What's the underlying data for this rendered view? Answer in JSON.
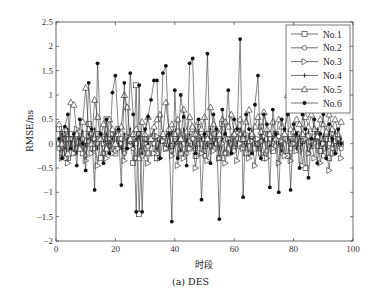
{
  "chart_data": {
    "type": "line",
    "title": "",
    "caption": "(a) DES",
    "xlabel": "时段",
    "ylabel": "RMSE/ns",
    "xlim": [
      0,
      100
    ],
    "ylim": [
      -2,
      2.5
    ],
    "xticks": [
      0,
      20,
      40,
      60,
      80,
      100
    ],
    "yticks": [
      -2,
      -1.5,
      -1,
      -0.5,
      0,
      0.5,
      1,
      1.5,
      2,
      2.5
    ],
    "ytick_labels": [
      "-2",
      "-1.5",
      "-1",
      "-0.5",
      "0",
      "0.5",
      "1",
      "1.5",
      "2",
      "2.5"
    ],
    "grid": false,
    "legend_position": "upper right",
    "series": [
      {
        "name": "No.1",
        "marker": "square",
        "values": [
          0.3,
          -0.2,
          0.1,
          -0.3,
          0.2,
          0.0,
          -0.1,
          0.15,
          -0.2,
          0.05,
          0.4,
          -0.1,
          0.0,
          0.2,
          -0.3,
          0.1,
          0.5,
          -0.05,
          0.1,
          -0.2,
          0.3,
          0.0,
          -0.15,
          0.1,
          0.05,
          -0.4,
          1.2,
          -1.45,
          0.2,
          0.1,
          -0.2,
          0.0,
          0.15,
          -0.3,
          0.1,
          0.05,
          -0.1,
          0.2,
          -0.05,
          0.1,
          0.25,
          -0.2,
          0.0,
          0.15,
          -0.1,
          0.3,
          -0.25,
          0.1,
          0.0,
          -0.15,
          0.2,
          0.05,
          -0.1,
          0.15,
          -0.3,
          0.4,
          -0.2,
          0.1,
          0.0,
          -0.1,
          0.25,
          -0.05,
          0.1,
          -0.2,
          0.05,
          0.15,
          -0.1,
          0.0,
          0.35,
          -0.3,
          0.1,
          0.05,
          -0.15,
          0.2,
          0.0,
          -0.1,
          0.15,
          -0.25,
          0.1,
          0.0,
          0.2,
          -0.1,
          0.05,
          -0.5,
          0.15,
          -0.05,
          0.1,
          0.2,
          -0.15,
          0.0,
          0.1,
          -0.3,
          0.25,
          -0.1,
          0.05,
          0.0
        ]
      },
      {
        "name": "No.2",
        "marker": "circle",
        "values": [
          -0.1,
          0.2,
          -0.3,
          0.1,
          0.0,
          -0.2,
          0.15,
          -0.05,
          0.1,
          -0.25,
          0.05,
          0.2,
          -0.1,
          0.0,
          0.15,
          -0.2,
          0.1,
          -0.05,
          0.2,
          -0.15,
          0.0,
          0.1,
          -0.2,
          0.05,
          0.15,
          -0.1,
          0.0,
          0.2,
          -0.25,
          0.1,
          -0.05,
          0.15,
          0.0,
          -0.2,
          0.1,
          0.05,
          -0.1,
          0.2,
          -0.15,
          0.0,
          0.1,
          -0.05,
          0.2,
          -0.2,
          0.05,
          0.1,
          -0.1,
          0.0,
          0.15,
          -0.25,
          0.1,
          -0.05,
          0.2,
          0.0,
          -0.1,
          0.15,
          -0.2,
          0.05,
          0.1,
          -0.15,
          0.0,
          0.2,
          -0.05,
          0.1,
          -0.2,
          0.15,
          0.0,
          -0.1,
          0.05,
          0.2,
          -0.15,
          0.1,
          0.0,
          -0.05,
          0.15,
          -0.2,
          0.1,
          0.05,
          -0.1,
          0.0,
          0.2,
          -0.15,
          0.05,
          0.1,
          -0.2,
          0.0,
          0.15,
          -0.05,
          0.1,
          -0.25,
          0.2,
          0.0,
          -0.1,
          0.05,
          0.15,
          -0.1
        ]
      },
      {
        "name": "No.3",
        "marker": "triangle-right",
        "values": [
          0.0,
          -0.3,
          0.2,
          -0.4,
          0.1,
          -0.2,
          0.3,
          -0.1,
          0.0,
          -0.35,
          0.15,
          -0.2,
          0.1,
          -0.45,
          0.2,
          0.0,
          -0.3,
          0.1,
          -0.2,
          0.25,
          -0.1,
          0.0,
          -0.35,
          0.15,
          -0.05,
          0.1,
          -0.3,
          0.2,
          -0.15,
          0.0,
          -0.4,
          0.1,
          -0.2,
          0.15,
          -0.3,
          0.05,
          -0.1,
          0.2,
          -0.25,
          0.0,
          -0.45,
          0.1,
          -0.3,
          0.2,
          -0.1,
          0.0,
          -0.5,
          0.15,
          -0.2,
          0.1,
          -0.35,
          0.05,
          -0.15,
          0.2,
          -0.3,
          0.0,
          -0.4,
          0.1,
          -0.2,
          0.15,
          -0.35,
          0.0,
          -0.1,
          0.2,
          -0.3,
          0.05,
          -0.45,
          0.1,
          -0.2,
          0.15,
          -0.3,
          0.0,
          -0.1,
          0.2,
          -0.4,
          0.05,
          -0.25,
          0.1,
          -0.35,
          0.0,
          -0.15,
          0.2,
          -0.45,
          0.1,
          -0.2,
          0.05,
          -0.3,
          0.15,
          -0.4,
          0.0,
          -0.1,
          -0.55,
          0.2,
          -0.2,
          0.1,
          -0.3
        ]
      },
      {
        "name": "No.4",
        "marker": "plus-dot",
        "values": [
          0.1,
          0.2,
          -0.1,
          0.3,
          0.0,
          0.15,
          -0.2,
          0.1,
          0.25,
          -0.05,
          0.2,
          0.0,
          0.3,
          -0.1,
          0.15,
          0.05,
          0.2,
          -0.15,
          0.1,
          0.25,
          0.0,
          -0.1,
          0.2,
          0.05,
          0.3,
          -0.05,
          0.1,
          0.15,
          -0.2,
          0.25,
          0.0,
          0.1,
          0.3,
          -0.1,
          0.05,
          0.2,
          0.15,
          -0.05,
          0.25,
          0.0,
          0.1,
          -0.15,
          0.3,
          0.05,
          0.2,
          0.0,
          -0.1,
          0.25,
          0.1,
          0.15,
          -0.05,
          0.3,
          0.0,
          0.2,
          -0.1,
          0.1,
          0.25,
          0.05,
          -0.15,
          0.2,
          0.0,
          0.3,
          0.1,
          -0.05,
          0.15,
          0.25,
          0.0,
          -0.1,
          0.2,
          0.05,
          0.3,
          -0.05,
          0.1,
          0.2,
          0.0,
          -0.15,
          0.25,
          0.1,
          0.05,
          0.3,
          -0.1,
          0.15,
          0.0,
          0.2,
          0.25,
          -0.05,
          0.1,
          0.3,
          0.0,
          0.15,
          -0.1,
          0.2,
          0.05,
          0.25,
          0.0,
          0.1
        ]
      },
      {
        "name": "No.5",
        "marker": "triangle-up",
        "values": [
          0.4,
          0.0,
          0.3,
          -0.2,
          0.85,
          0.8,
          0.2,
          -0.1,
          0.45,
          1.15,
          0.3,
          0.0,
          0.9,
          0.55,
          0.1,
          0.4,
          -0.1,
          0.5,
          0.3,
          0.0,
          0.2,
          0.35,
          1.0,
          0.75,
          0.1,
          0.2,
          0.3,
          -0.3,
          0.45,
          0.2,
          0.55,
          0.1,
          0.35,
          0.5,
          0.6,
          0.2,
          0.85,
          0.3,
          0.4,
          0.2,
          0.5,
          0.1,
          0.7,
          0.25,
          0.55,
          0.35,
          0.2,
          0.45,
          0.3,
          0.55,
          0.1,
          0.75,
          0.4,
          0.3,
          0.2,
          0.5,
          0.45,
          0.35,
          0.6,
          0.2,
          0.3,
          0.5,
          0.1,
          0.45,
          0.7,
          0.2,
          0.35,
          0.55,
          0.25,
          0.65,
          0.3,
          0.2,
          0.45,
          0.1,
          0.5,
          0.35,
          0.2,
          1.0,
          0.3,
          0.25,
          0.5,
          0.4,
          0.2,
          0.55,
          0.35,
          0.6,
          0.3,
          0.15,
          0.5,
          0.4,
          0.25,
          0.6,
          0.3,
          0.5,
          0.2,
          0.45
        ]
      },
      {
        "name": "No.6",
        "marker": "filled-dot",
        "values": [
          0.1,
          -0.3,
          0.35,
          0.6,
          -0.1,
          0.2,
          -0.45,
          0.5,
          0.0,
          -0.55,
          1.25,
          0.3,
          -0.95,
          1.65,
          0.2,
          -0.4,
          0.5,
          -0.2,
          1.05,
          1.4,
          0.3,
          -0.85,
          1.25,
          -0.1,
          1.45,
          0.6,
          -1.4,
          1.2,
          -1.4,
          0.3,
          0.55,
          0.9,
          1.3,
          1.3,
          -0.3,
          1.45,
          1.6,
          0.2,
          -1.6,
          1.1,
          -0.3,
          1.0,
          0.55,
          -0.45,
          1.65,
          1.75,
          -0.2,
          0.5,
          -1.15,
          0.2,
          1.85,
          -0.4,
          0.6,
          0.3,
          -1.55,
          0.7,
          0.2,
          1.1,
          -0.2,
          0.5,
          0.3,
          2.15,
          -1.1,
          0.6,
          0.3,
          -0.2,
          0.8,
          1.4,
          -0.3,
          0.6,
          0.4,
          -0.9,
          0.7,
          0.2,
          -1.0,
          0.5,
          0.3,
          0.6,
          -0.95,
          0.4,
          0.2,
          -0.5,
          0.6,
          0.3,
          -0.7,
          0.1,
          0.5,
          -0.4,
          0.2,
          0.6,
          -0.3,
          0.4,
          0.1,
          -0.2,
          0.3,
          0.0
        ]
      }
    ]
  }
}
